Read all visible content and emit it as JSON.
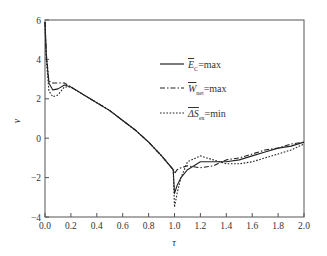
{
  "chart_data": {
    "type": "line",
    "title": "",
    "xlabel": "τ",
    "ylabel": "ν",
    "xlim": [
      0.0,
      2.0
    ],
    "ylim": [
      -4,
      6
    ],
    "x_ticks": [
      "0.0",
      "0.2",
      "0.4",
      "0.6",
      "0.8",
      "1.0",
      "1.2",
      "1.4",
      "1.6",
      "1.8",
      "2.0"
    ],
    "y_ticks": [
      "-4",
      "-2",
      "0",
      "2",
      "4",
      "6"
    ],
    "grid": false,
    "legend_position": "upper center",
    "series": [
      {
        "name": "E_C=max",
        "legend_main": "E",
        "legend_sub": "C",
        "legend_suffix": "=max",
        "style": "solid",
        "x": [
          0.0,
          0.01,
          0.03,
          0.06,
          0.1,
          0.15,
          0.2,
          0.3,
          0.4,
          0.5,
          0.6,
          0.7,
          0.8,
          0.9,
          0.99,
          1.0,
          1.02,
          1.05,
          1.1,
          1.2,
          1.3,
          1.4,
          1.5,
          1.6,
          1.7,
          1.8,
          1.9,
          2.0
        ],
        "values": [
          5.9,
          4.2,
          2.8,
          2.45,
          2.5,
          2.7,
          2.6,
          2.2,
          1.8,
          1.4,
          0.9,
          0.4,
          -0.2,
          -0.9,
          -1.6,
          -2.8,
          -2.4,
          -2.0,
          -1.6,
          -1.2,
          -1.2,
          -1.2,
          -1.1,
          -0.9,
          -0.7,
          -0.5,
          -0.4,
          -0.2
        ]
      },
      {
        "name": "W_net=max",
        "legend_main": "W",
        "legend_sub": "net",
        "legend_suffix": "=max",
        "style": "dashdot",
        "x": [
          0.0,
          0.01,
          0.03,
          0.06,
          0.1,
          0.15,
          0.2,
          0.3,
          0.4,
          0.5,
          0.6,
          0.7,
          0.8,
          0.9,
          0.99,
          1.0,
          1.02,
          1.05,
          1.1,
          1.2,
          1.3,
          1.4,
          1.5,
          1.6,
          1.7,
          1.8,
          1.9,
          2.0
        ],
        "values": [
          5.9,
          4.3,
          2.9,
          2.8,
          2.8,
          2.8,
          2.6,
          2.2,
          1.8,
          1.4,
          0.9,
          0.4,
          -0.2,
          -0.9,
          -1.6,
          -1.8,
          -1.6,
          -1.5,
          -1.4,
          -1.5,
          -1.4,
          -1.1,
          -1.0,
          -0.8,
          -0.6,
          -0.5,
          -0.3,
          -0.2
        ]
      },
      {
        "name": "ΔS_ex=min",
        "legend_main": "ΔS",
        "legend_sub": "ex",
        "legend_suffix": "=min",
        "style": "dotted",
        "x": [
          0.0,
          0.01,
          0.03,
          0.06,
          0.1,
          0.15,
          0.2,
          0.3,
          0.4,
          0.5,
          0.6,
          0.7,
          0.8,
          0.9,
          0.99,
          1.0,
          1.02,
          1.05,
          1.1,
          1.2,
          1.3,
          1.4,
          1.5,
          1.6,
          1.7,
          1.8,
          1.9,
          2.0
        ],
        "values": [
          5.9,
          4.0,
          2.4,
          2.1,
          2.2,
          2.6,
          2.6,
          2.2,
          1.8,
          1.4,
          0.9,
          0.4,
          -0.2,
          -0.9,
          -1.6,
          -3.5,
          -2.8,
          -2.0,
          -1.2,
          -0.9,
          -1.1,
          -1.3,
          -1.3,
          -1.2,
          -1.0,
          -0.8,
          -0.6,
          -0.3
        ]
      }
    ]
  }
}
